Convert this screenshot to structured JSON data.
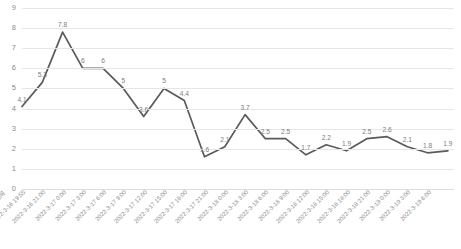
{
  "chart_data": {
    "type": "line",
    "title": "",
    "xlabel": "日期时间",
    "ylabel": "",
    "ylim": [
      0,
      9
    ],
    "yticks": [
      9,
      8,
      7,
      6,
      5,
      4,
      3,
      2,
      1,
      0
    ],
    "grid": true,
    "legend": "none",
    "line_color": "#5a5a5a",
    "grid_color": "#e6e6e6",
    "label_color": "#8c8c8c",
    "categories": [
      "2022-3-16 19:55",
      "2022-3-16 21:00",
      "2022-3-17 0:00",
      "2022-3-17 3:00",
      "2022-3-17 6:00",
      "2022-3-17 9:00",
      "2022-3-17 12:00",
      "2022-3-17 15:00",
      "2022-3-17 18:00",
      "2022-3-17 21:00",
      "2022-3-18 0:00",
      "2022-3-18 3:00",
      "2022-3-18 6:00",
      "2022-3-18 9:00",
      "2022-3-18 12:00",
      "2022-3-18 15:00",
      "2022-3-18 18:00",
      "2022-3-18 21:00",
      "2022-3-19 0:00",
      "2022-3-19 3:00",
      "2022-3-19 6:00"
    ],
    "values": [
      4.1,
      5.3,
      7.8,
      6,
      6,
      5,
      3.6,
      5,
      4.4,
      1.6,
      2.1,
      3.7,
      2.5,
      2.5,
      1.7,
      2.2,
      1.9,
      2.5,
      2.6,
      2.1,
      1.8
    ],
    "point_labels": [
      "4.1",
      "5.3",
      "7.8",
      "6",
      "6",
      "5",
      "3.6",
      "5",
      "4.4",
      "1.6",
      "2.1",
      "3.7",
      "2.5",
      "2.5",
      "1.7",
      "2.2",
      "1.9",
      "2.5",
      "2.6",
      "2.1",
      "1.8"
    ],
    "trailing_value": 1.9,
    "trailing_label": "1.9"
  },
  "caption": ""
}
